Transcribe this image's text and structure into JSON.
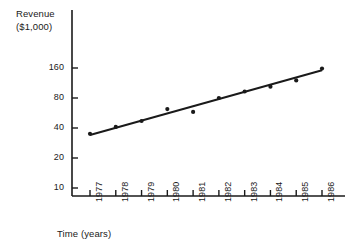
{
  "chart_data": {
    "type": "scatter",
    "title": "",
    "subtitle": "",
    "ylabel": "Revenue\n($1,000)",
    "ylabel_lines": [
      "Revenue",
      "($1,000)"
    ],
    "xlabel": "Time (years)",
    "categories": [
      "1977",
      "1978",
      "1979",
      "1980",
      "1981",
      "1982",
      "1983",
      "1984",
      "1985",
      "1986"
    ],
    "x": [
      1977,
      1978,
      1979,
      1980,
      1981,
      1982,
      1983,
      1984,
      1985,
      1986
    ],
    "values": [
      35,
      41,
      47,
      62,
      58,
      80,
      93,
      104,
      120,
      158
    ],
    "series": [
      {
        "name": "Revenue",
        "values": [
          35,
          41,
          47,
          62,
          58,
          80,
          93,
          104,
          120,
          158
        ],
        "marker": "dot",
        "color": "#1a1a1a"
      },
      {
        "name": "Trend line",
        "type": "line",
        "values": [
          34,
          40,
          47,
          55,
          65,
          76,
          90,
          105,
          124,
          152
        ],
        "color": "#1a1a1a"
      }
    ],
    "yscale": "log",
    "ylim": [
      8.4,
      200
    ],
    "yticks": [
      10,
      20,
      40,
      80,
      160
    ],
    "ytick_labels": [
      "10",
      "20",
      "40",
      "80",
      "160"
    ],
    "xtick_labels": [
      "1977",
      "1978",
      "1979",
      "1980",
      "1981",
      "1982",
      "1983",
      "1984",
      "1985",
      "1986"
    ],
    "xtick_rotation": -90,
    "grid": false,
    "legend": "none",
    "axis_color": "#1a1a1a",
    "background": "#ffffff"
  }
}
